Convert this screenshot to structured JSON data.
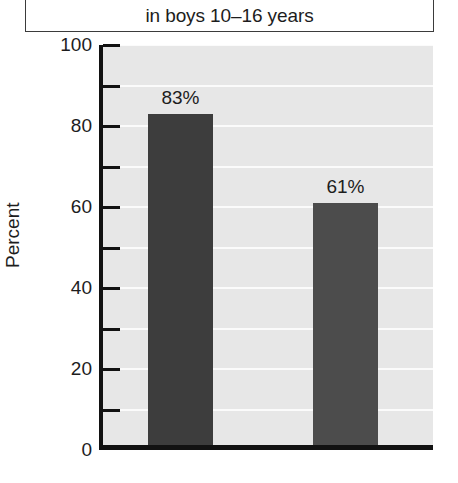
{
  "title": {
    "line": "in boys 10–16 years"
  },
  "axes": {
    "ylabel": "Percent",
    "ytick_labels": [
      "100",
      "80",
      "60",
      "40",
      "20",
      "0"
    ]
  },
  "chart_data": {
    "type": "bar",
    "title": "in boys 10–16 years",
    "xlabel": "",
    "ylabel": "Percent",
    "ylim": [
      0,
      100
    ],
    "ytick_values": [
      0,
      20,
      40,
      60,
      80,
      100
    ],
    "yminor_tick_values": [
      10,
      30,
      50,
      70,
      90
    ],
    "grid": true,
    "grid_axis": "y",
    "grid_interval": 10,
    "legend": false,
    "categories": [
      "",
      ""
    ],
    "values": [
      83,
      61
    ],
    "data_labels": [
      "83%",
      "61%"
    ],
    "bar_colors": [
      "#3d3d3d",
      "#4c4c4c"
    ],
    "plot_background": "#e7e7e7",
    "gridline_color": "#fbfbfb",
    "axis_color": "#121212"
  }
}
